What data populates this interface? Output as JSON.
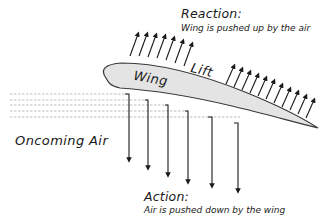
{
  "diagram": {
    "reaction": {
      "title": "Reaction:",
      "description": "Wing is pushed up by the air"
    },
    "lift_label": "Lift",
    "wing_label": "Wing",
    "oncoming_air_label": "Oncoming Air",
    "action": {
      "title": "Action:",
      "description": "Air is pushed down by the wing"
    },
    "colors": {
      "wing_fill": "#e4e4e4",
      "wing_outline": "#3a3a3a",
      "arrows": "#1a1a1a",
      "airflow_dashes": "#b5b5b5",
      "background": "#ffffff"
    },
    "counts": {
      "lift_arrows": 17,
      "downwash_arrows": 6,
      "airflow_lines": 5
    }
  }
}
